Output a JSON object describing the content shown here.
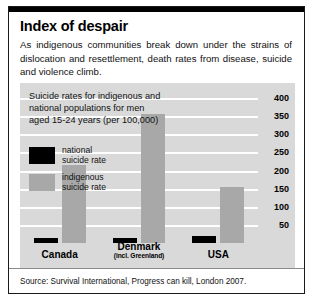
{
  "figure": {
    "title": "Index of despair",
    "standfirst": "As indigenous communities break down under the strains of dislocation and resettlement, death rates from disease, suicide and violence climb.",
    "source": "Source: Survival International, Progress can kill, London 2007."
  },
  "panel": {
    "caption": "Suicide rates for indigenous and national populations for men aged 15-24 years (per 100,000)",
    "legend": [
      {
        "key": "national",
        "line1": "national",
        "line2": "suicide rate",
        "color": "#000000"
      },
      {
        "key": "indigenous",
        "line1": "indigenous",
        "line2": "suicide rate",
        "color": "#a8a8a8"
      }
    ]
  },
  "chart_data": {
    "type": "bar",
    "title": "Suicide rates for indigenous and national populations for men aged 15-24 years (per 100,000)",
    "xlabel": "",
    "ylabel": "per 100,000",
    "ylim": [
      0,
      425
    ],
    "yticks": [
      50,
      100,
      150,
      200,
      250,
      300,
      350,
      400
    ],
    "grid": true,
    "legend_position": "inside-left",
    "categories": [
      "Canada",
      "Denmark",
      "USA"
    ],
    "category_sublabels": [
      "",
      "(incl. Greenland)",
      ""
    ],
    "series": [
      {
        "name": "national suicide rate",
        "color": "#000000",
        "values": [
          15,
          14,
          18
        ]
      },
      {
        "name": "indigenous suicide rate",
        "color": "#a8a8a8",
        "values": [
          215,
          355,
          155
        ]
      }
    ]
  }
}
